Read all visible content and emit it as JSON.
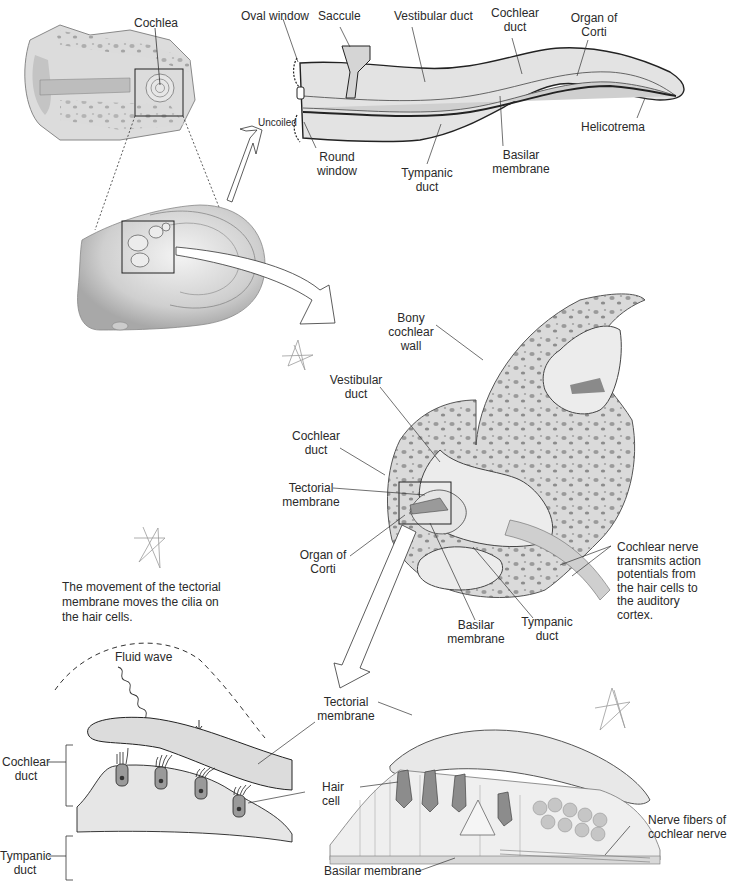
{
  "figure": {
    "panels": [
      {
        "id": "ear-overview",
        "labels": {
          "cochlea": "Cochlea"
        }
      },
      {
        "id": "uncoiled-cochlea",
        "transition_label": "Uncoiled",
        "labels": {
          "oval_window": "Oval window",
          "saccule": "Saccule",
          "vestibular_duct": "Vestibular duct",
          "cochlear_duct_l1": "Cochlear",
          "cochlear_duct_l2": "duct",
          "organ_of_corti_l1": "Organ of",
          "organ_of_corti_l2": "Corti",
          "helicotrema": "Helicotrema",
          "round_window_l1": "Round",
          "round_window_l2": "window",
          "tympanic_duct_l1": "Tympanic",
          "tympanic_duct_l2": "duct",
          "basilar_membrane_l1": "Basilar",
          "basilar_membrane_l2": "membrane"
        }
      },
      {
        "id": "cochlea-cross-section",
        "labels": {
          "bony_wall_l1": "Bony",
          "bony_wall_l2": "cochlear",
          "bony_wall_l3": "wall",
          "vestibular_duct_l1": "Vestibular",
          "vestibular_duct_l2": "duct",
          "cochlear_duct_l1": "Cochlear",
          "cochlear_duct_l2": "duct",
          "tectorial_membrane_l1": "Tectorial",
          "tectorial_membrane_l2": "membrane",
          "organ_of_corti_l1": "Organ of",
          "organ_of_corti_l2": "Corti",
          "basilar_membrane_l1": "Basilar",
          "basilar_membrane_l2": "membrane",
          "tympanic_duct_l1": "Tympanic",
          "tympanic_duct_l2": "duct",
          "cochlear_nerve_lines": [
            "Cochlear nerve",
            "transmits action",
            "potentials from",
            "the hair cells to",
            "the auditory",
            "cortex."
          ]
        }
      },
      {
        "id": "schematic-hair-cells",
        "caption_lines": [
          "The movement of the tectorial",
          "membrane moves the cilia on",
          "the hair cells."
        ],
        "labels": {
          "fluid_wave": "Fluid wave",
          "cochlear_duct_l1": "Cochlear",
          "cochlear_duct_l2": "duct",
          "tympanic_duct_l1": "Tympanic",
          "tympanic_duct_l2": "duct"
        }
      },
      {
        "id": "organ-of-corti-detail",
        "labels": {
          "tectorial_membrane_l1": "Tectorial",
          "tectorial_membrane_l2": "membrane",
          "hair_cell_l1": "Hair",
          "hair_cell_l2": "cell",
          "basilar_membrane": "Basilar membrane",
          "nerve_fibers_l1": "Nerve fibers of",
          "nerve_fibers_l2": "cochlear nerve"
        }
      }
    ],
    "colors": {
      "tissue_fill": "#d9d9d9",
      "tissue_light": "#e8e8e8",
      "outline": "#222222",
      "leader_line": "#333333",
      "scribble": "#9a9a9a"
    }
  }
}
